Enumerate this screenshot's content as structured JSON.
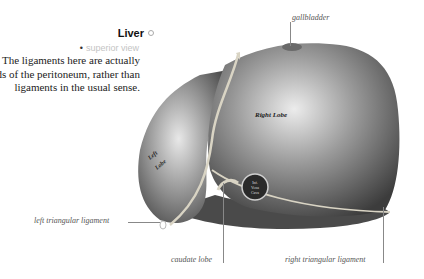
{
  "figure": {
    "title": "Liver",
    "title_icon": "circle-icon",
    "subtitle": "superior view",
    "description": "The ligaments here are actually folds of the peritoneum, rather than ligaments in the usual sense.",
    "illustration_labels": {
      "right_lobe": "Right Lobe",
      "left_lobe": "Left Lobe",
      "vena_cava": "Inf. Vena Cava"
    },
    "callouts": [
      {
        "id": "gallbladder",
        "text": "gallbladder"
      },
      {
        "id": "left_triangular",
        "text": "left triangular ligament"
      },
      {
        "id": "caudate_lobe",
        "text": "caudate lobe"
      },
      {
        "id": "right_triangular",
        "text": "right triangular ligament"
      }
    ]
  },
  "colors": {
    "liver_dark": "#3a3a3a",
    "liver_mid": "#8a8a8a",
    "liver_light": "#e6e6e6",
    "ligament": "#d9d4c4"
  }
}
